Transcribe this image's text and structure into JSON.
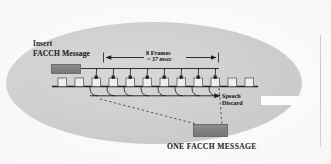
{
  "figure": {
    "caption": "ONE FACCH MESSAGE",
    "labels": {
      "insert_line1": "Insert",
      "insert_line2": "FACCH Message",
      "frames_line1": "8 Frames",
      "frames_line2": "~ 37 msec",
      "speech_line1": "Speech",
      "speech_line2": "Discard"
    },
    "colors": {
      "ellipse_fill": "#cfcfcf",
      "block_fill": "#828282",
      "line": "#1f1f1f",
      "text": "#2b2b2b",
      "page_background": "#fdfdfd"
    },
    "timeline": {
      "frame_count": 12,
      "stolen_frame_count": 8,
      "frame_box_label": "",
      "axis_start_x": 56,
      "axis_end_x": 256
    },
    "dimension": {
      "span_label": "8 Frames ~ 37 msec",
      "start_x": 103,
      "end_x": 219
    }
  }
}
